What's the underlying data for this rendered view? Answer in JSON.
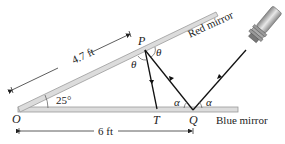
{
  "diagram": {
    "points": {
      "O": "O",
      "P": "P",
      "T": "T",
      "Q": "Q"
    },
    "angles": {
      "mirror_angle": "25°",
      "theta": "θ",
      "alpha": "α"
    },
    "dimensions": {
      "OP_length": "4.7 ft",
      "OQ_length": "6 ft"
    },
    "mirrors": {
      "top": "Red mirror",
      "bottom": "Blue mirror"
    },
    "light_source": "flashlight",
    "colors": {
      "mirror_fill": "#d9d9d9",
      "mirror_edge": "#9a9a9a",
      "ray": "#1a1a1a",
      "text": "#222222"
    }
  }
}
